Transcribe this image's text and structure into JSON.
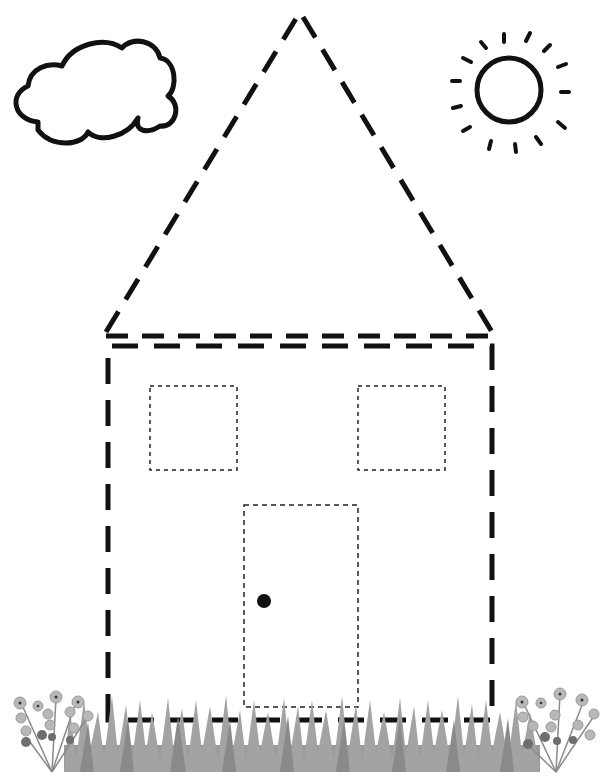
{
  "worksheet": {
    "subject": "house tracing worksheet",
    "elements": {
      "cloud": {
        "label": "cloud"
      },
      "sun": {
        "label": "sun",
        "ray_count": 12
      },
      "roof": {
        "label": "triangle roof",
        "style": "dashed"
      },
      "walls": {
        "label": "square house body",
        "style": "dashed"
      },
      "windows": [
        {
          "label": "left window",
          "style": "fine dashed"
        },
        {
          "label": "right window",
          "style": "fine dashed"
        }
      ],
      "door": {
        "label": "door",
        "style": "fine dashed",
        "has_knob": true
      },
      "grass": {
        "label": "grass strip"
      },
      "flowers": [
        {
          "label": "left flower bouquet"
        },
        {
          "label": "right flower bouquet"
        }
      ]
    },
    "colors": {
      "line": "#111111",
      "grass": "#9a9a9a",
      "grass_dark": "#7d7d7d",
      "flower_fill": "#b5b5b5",
      "flower_dark": "#6e6e6e",
      "background": "#ffffff"
    }
  }
}
